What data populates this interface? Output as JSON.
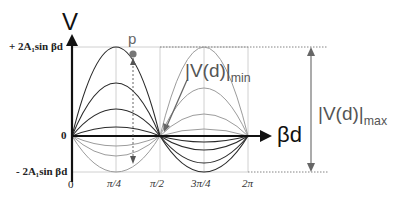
{
  "diagram": {
    "y_axis_label": "V",
    "x_axis_label": "βd",
    "y_top_label": "+ 2A₁sin βd",
    "y_bottom_label": "- 2A₁sin βd",
    "origin_label": "0",
    "zero_label": "0",
    "point_label": "p",
    "vmin_label": "|V(d)|",
    "vmin_sub": "min",
    "vmax_label": "|V(d)|",
    "vmax_sub": "max",
    "x_ticks": [
      "π/4",
      "π/2",
      "3π/4",
      "2π"
    ]
  },
  "colors": {
    "axis": "#111111",
    "curve_dark": "#222222",
    "curve_light": "#9a9a9a",
    "grid": "#bbbbbb",
    "text": "#222222",
    "annot": "#555555"
  }
}
